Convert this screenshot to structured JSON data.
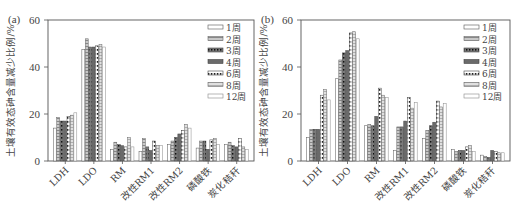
{
  "chart_data": [
    {
      "type": "bar",
      "panel_label": "(a)",
      "title": "",
      "xlabel": "",
      "ylabel": "土壤有效态砷含量减少比例/%",
      "ylim": [
        0,
        60
      ],
      "yticks": [
        0,
        20,
        40,
        60
      ],
      "grid": false,
      "legend_position": "top-right",
      "categories": [
        "LDH",
        "LDO",
        "RM",
        "改性RM1",
        "改性RM2",
        "磷酸铁",
        "炭化秸秆"
      ],
      "series": [
        {
          "name": "1周",
          "values": [
            14,
            47.5,
            5,
            4,
            7,
            5.5,
            7
          ]
        },
        {
          "name": "2周",
          "values": [
            18.5,
            52,
            8,
            9.5,
            8.5,
            8.5,
            8
          ]
        },
        {
          "name": "3周",
          "values": [
            17,
            48.5,
            7,
            6,
            10,
            8.5,
            6.5
          ]
        },
        {
          "name": "4周",
          "values": [
            17,
            48.5,
            6.5,
            4.5,
            11.5,
            5,
            6
          ]
        },
        {
          "name": "6周",
          "values": [
            19,
            49,
            6,
            8.5,
            13,
            9,
            9.5
          ]
        },
        {
          "name": "8周",
          "values": [
            19.5,
            49.5,
            10,
            6.5,
            15.5,
            9.5,
            6
          ]
        },
        {
          "name": "12周",
          "values": [
            20.5,
            48.5,
            6,
            6.5,
            14,
            7,
            5
          ]
        }
      ]
    },
    {
      "type": "bar",
      "panel_label": "(b)",
      "title": "",
      "xlabel": "",
      "ylabel": "土壤有效态砷含量减少比例/%",
      "ylim": [
        0,
        60
      ],
      "yticks": [
        0,
        20,
        40,
        60
      ],
      "grid": false,
      "legend_position": "top-right",
      "categories": [
        "LDH",
        "LDO",
        "RM",
        "改性RM1",
        "改性RM2",
        "磷酸铁",
        "炭化秸秆"
      ],
      "series": [
        {
          "name": "1周",
          "values": [
            10,
            35,
            15,
            4.5,
            9.5,
            5,
            2.5
          ]
        },
        {
          "name": "2周",
          "values": [
            13.5,
            43,
            15.5,
            14.5,
            13,
            4,
            2
          ]
        },
        {
          "name": "3周",
          "values": [
            13.5,
            46,
            15,
            14.5,
            15,
            4.5,
            1.5
          ]
        },
        {
          "name": "4周",
          "values": [
            13.5,
            47,
            19,
            17,
            16.5,
            4.5,
            4.5
          ]
        },
        {
          "name": "6周",
          "values": [
            28,
            54.5,
            31,
            27,
            25.5,
            6,
            4
          ]
        },
        {
          "name": "8周",
          "values": [
            30.5,
            55,
            28,
            22.5,
            23,
            6.5,
            3.5
          ]
        },
        {
          "name": "12周",
          "values": [
            26,
            52,
            27,
            25,
            24.5,
            4,
            3.5
          ]
        }
      ]
    }
  ],
  "series_styles": [
    {
      "fill": "#ffffff",
      "pattern": "none"
    },
    {
      "fill": "#b0b0b0",
      "pattern": "hlines"
    },
    {
      "fill": "#606060",
      "pattern": "dots"
    },
    {
      "fill": "#707070",
      "pattern": "solid"
    },
    {
      "fill": "#ffffff",
      "pattern": "dots-dark"
    },
    {
      "fill": "#d0d0d0",
      "pattern": "hlines"
    },
    {
      "fill": "#ffffff",
      "pattern": "none"
    }
  ]
}
